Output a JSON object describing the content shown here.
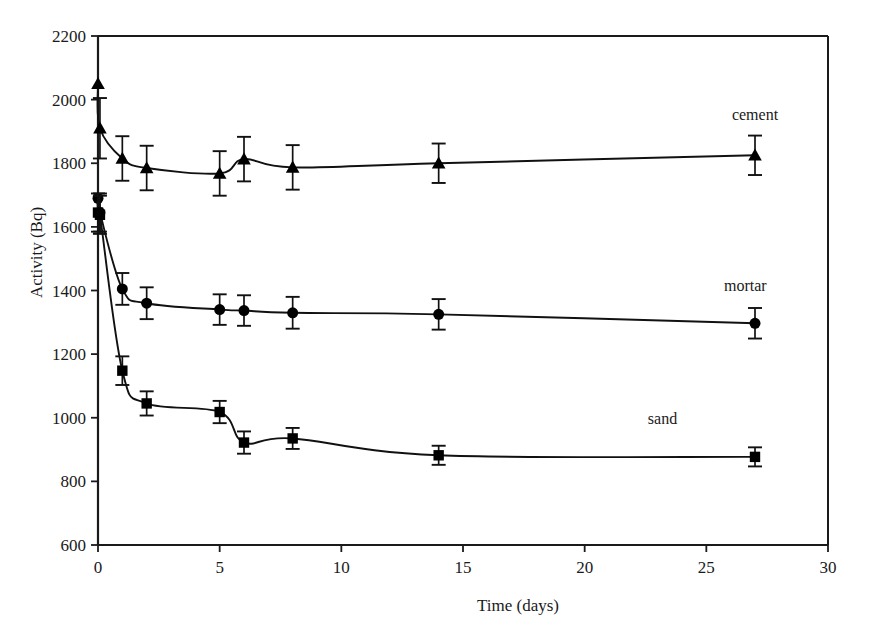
{
  "chart_data": {
    "type": "line",
    "title": "",
    "xlabel": "Time (days)",
    "ylabel": "Activity (Bq)",
    "xlim": [
      0,
      30
    ],
    "ylim": [
      600,
      2200
    ],
    "xticks": [
      0,
      5,
      10,
      15,
      20,
      25,
      30
    ],
    "yticks": [
      600,
      800,
      1000,
      1200,
      1400,
      1600,
      1800,
      2000,
      2200
    ],
    "grid": false,
    "legend_position": "inline-right",
    "series": [
      {
        "name": "cement",
        "marker": "triangle",
        "label_x": 27.0,
        "label_y": 1935,
        "points": [
          {
            "x": 0.0,
            "y": 2050,
            "err": 0
          },
          {
            "x": 0.08,
            "y": 1910,
            "err": 95
          },
          {
            "x": 1.0,
            "y": 1815,
            "err": 70
          },
          {
            "x": 2.0,
            "y": 1785,
            "err": 70
          },
          {
            "x": 5.0,
            "y": 1768,
            "err": 70
          },
          {
            "x": 6.0,
            "y": 1813,
            "err": 70
          },
          {
            "x": 8.0,
            "y": 1787,
            "err": 70
          },
          {
            "x": 14.0,
            "y": 1800,
            "err": 62
          },
          {
            "x": 27.0,
            "y": 1825,
            "err": 62
          }
        ]
      },
      {
        "name": "mortar",
        "marker": "circle",
        "label_x": 26.6,
        "label_y": 1400,
        "points": [
          {
            "x": 0.0,
            "y": 1690,
            "err": 0
          },
          {
            "x": 0.08,
            "y": 1645,
            "err": 60
          },
          {
            "x": 1.0,
            "y": 1405,
            "err": 50
          },
          {
            "x": 2.0,
            "y": 1360,
            "err": 50
          },
          {
            "x": 5.0,
            "y": 1340,
            "err": 48
          },
          {
            "x": 6.0,
            "y": 1337,
            "err": 48
          },
          {
            "x": 8.0,
            "y": 1330,
            "err": 50
          },
          {
            "x": 14.0,
            "y": 1325,
            "err": 48
          },
          {
            "x": 27.0,
            "y": 1297,
            "err": 48
          }
        ]
      },
      {
        "name": "sand",
        "marker": "square",
        "label_x": 23.2,
        "label_y": 980,
        "points": [
          {
            "x": 0.0,
            "y": 1645,
            "err": 60
          },
          {
            "x": 0.08,
            "y": 1638,
            "err": 60
          },
          {
            "x": 1.0,
            "y": 1148,
            "err": 45
          },
          {
            "x": 2.0,
            "y": 1045,
            "err": 38
          },
          {
            "x": 5.0,
            "y": 1018,
            "err": 35
          },
          {
            "x": 6.0,
            "y": 922,
            "err": 35
          },
          {
            "x": 8.0,
            "y": 935,
            "err": 33
          },
          {
            "x": 14.0,
            "y": 882,
            "err": 30
          },
          {
            "x": 27.0,
            "y": 877,
            "err": 30
          }
        ]
      }
    ]
  },
  "axes": {
    "x_title": "Time (days)",
    "y_title": "Activity (Bq)",
    "x_tick_labels": [
      "0",
      "5",
      "10",
      "15",
      "20",
      "25",
      "30"
    ],
    "y_tick_labels": [
      "600",
      "800",
      "1000",
      "1200",
      "1400",
      "1600",
      "1800",
      "2000",
      "2200"
    ]
  },
  "series_labels": {
    "cement": "cement",
    "mortar": "mortar",
    "sand": "sand"
  },
  "colors": {
    "line": "#111111",
    "marker": "#000000",
    "axis": "#1a1a1a",
    "background": "#ffffff"
  }
}
